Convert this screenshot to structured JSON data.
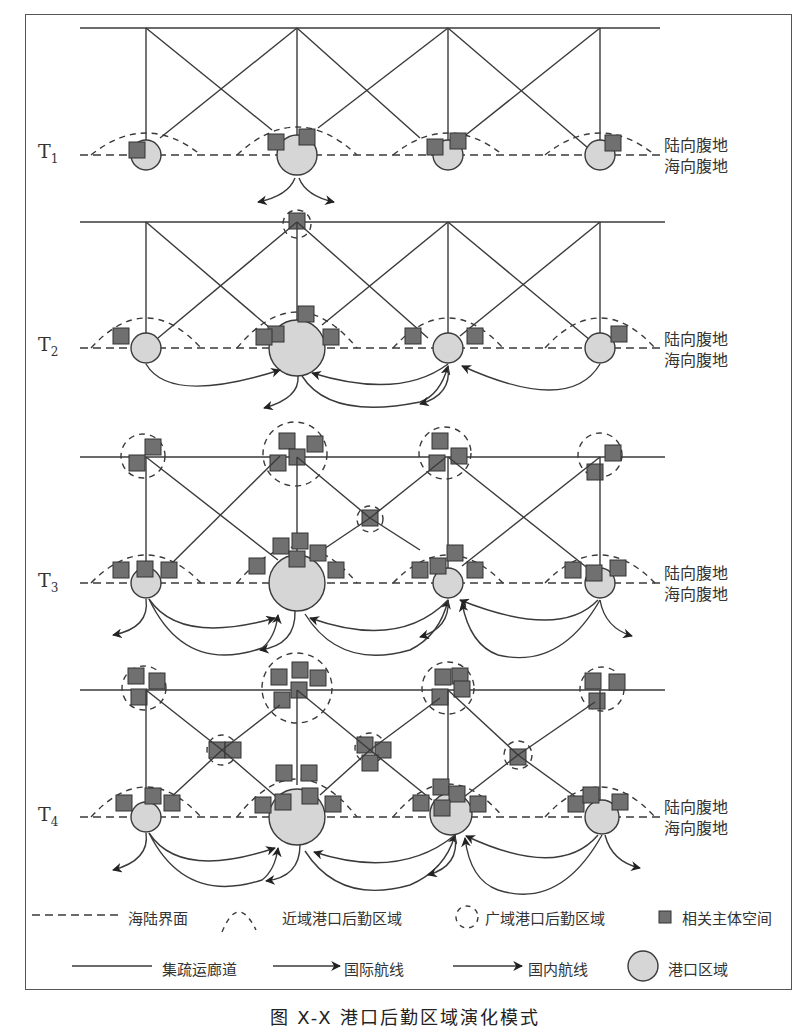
{
  "figure": {
    "caption": "图 X-X 港口后勤区域演化模式",
    "stages": [
      {
        "id": "T1",
        "label": "T",
        "sub": "1"
      },
      {
        "id": "T2",
        "label": "T",
        "sub": "2"
      },
      {
        "id": "T3",
        "label": "T",
        "sub": "3"
      },
      {
        "id": "T4",
        "label": "T",
        "sub": "4"
      }
    ],
    "side_labels": {
      "land": "陆向腹地",
      "sea": "海向腹地"
    }
  },
  "legend": {
    "sea_land_interface": "海陆界面",
    "near_logistics_area": "近域港口后勤区域",
    "wide_logistics_area": "广域港口后勤区域",
    "related_entity_space": "相关主体空间",
    "collection_corridor": "集疏运廊道",
    "international_route": "国际航线",
    "domestic_route": "国内航线",
    "port_area": "港口区域"
  },
  "colors": {
    "port_fill": "#d6d6d6",
    "entity_fill": "#707070",
    "line": "#3a3a3a"
  }
}
